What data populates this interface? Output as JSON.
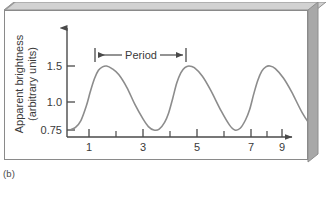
{
  "figure": {
    "caption": "(b)"
  },
  "chart_data": {
    "type": "line",
    "title": "",
    "xlabel": "Time (days)",
    "ylabel": "Apparent brightness\n(arbitrary units)",
    "ylabel_line1": "Apparent brightness",
    "ylabel_line2": "(arbitrary units)",
    "xlim": [
      0.2,
      9.6
    ],
    "ylim": [
      0.75,
      1.72
    ],
    "grid": false,
    "legend": null,
    "x_ticks_major": [
      1,
      3,
      5,
      7,
      9
    ],
    "x_tick_labels": [
      "1",
      "3",
      "5",
      "7",
      "9"
    ],
    "x_ticks_minor": [
      2,
      4,
      6,
      8
    ],
    "y_ticks": [
      0.75,
      1.0,
      1.5
    ],
    "y_tick_labels": [
      "0.75",
      "1.0",
      "1.5"
    ],
    "series": [
      {
        "name": "Cepheid light curve",
        "color": "#8c8c8c",
        "period_days": 3,
        "peak_brightness": 1.5,
        "minimum_brightness": 0.75,
        "peak_times": [
          1.5,
          4.5,
          7.5
        ],
        "trough_times": [
          3.4,
          6.4,
          9.4
        ],
        "x": [
          0.35,
          0.5,
          0.7,
          0.9,
          1.05,
          1.2,
          1.35,
          1.5,
          1.65,
          1.85,
          2.1,
          2.4,
          2.7,
          3.0,
          3.2,
          3.4,
          3.6,
          3.8,
          3.95,
          4.1,
          4.25,
          4.4,
          4.55,
          4.7,
          4.9,
          5.2,
          5.5,
          5.9,
          6.2,
          6.4,
          6.6,
          6.8,
          6.95,
          7.1,
          7.25,
          7.4,
          7.55,
          7.7,
          7.9,
          8.2,
          8.5,
          8.9,
          9.2,
          9.4
        ],
        "y": [
          0.76,
          0.78,
          0.86,
          1.03,
          1.2,
          1.35,
          1.45,
          1.49,
          1.5,
          1.47,
          1.4,
          1.25,
          1.05,
          0.88,
          0.79,
          0.75,
          0.76,
          0.84,
          0.95,
          1.12,
          1.3,
          1.42,
          1.48,
          1.5,
          1.48,
          1.38,
          1.22,
          0.97,
          0.81,
          0.75,
          0.77,
          0.87,
          0.99,
          1.17,
          1.33,
          1.44,
          1.49,
          1.5,
          1.47,
          1.36,
          1.2,
          0.95,
          0.81,
          0.76
        ]
      }
    ],
    "annotations": [
      {
        "name": "period-span",
        "label": "Period",
        "x_start": 1.5,
        "x_end": 4.5,
        "y": 1.62,
        "style": "double-arrow-with-end-caps"
      }
    ]
  },
  "colors": {
    "curve": "#8c8c8c",
    "axis": "#4a4a4a",
    "panel_border": "#8a8a8a",
    "bevel_light": "#d6d6d6",
    "bevel_mid": "#b4b4b4",
    "bevel_dark": "#8e8e8e",
    "text": "#3a3a3a"
  }
}
